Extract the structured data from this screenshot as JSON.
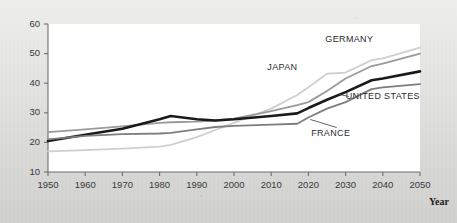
{
  "figure": {
    "background_color": "#d8d8d6",
    "plot_background_color": "#ffffff",
    "axis_color": "#6e6e6e"
  },
  "axis_titles": {
    "x": "Year",
    "y": ""
  },
  "chart_data": {
    "type": "line",
    "title": "",
    "subtitle": "",
    "xlabel": "Year",
    "ylabel": "",
    "xlim": [
      1950,
      2050
    ],
    "ylim": [
      10,
      60
    ],
    "xticks": [
      1950,
      1960,
      1970,
      1980,
      1990,
      2000,
      2010,
      2020,
      2030,
      2040,
      2050
    ],
    "yticks": [
      10,
      20,
      30,
      40,
      50,
      60
    ],
    "grid": false,
    "legend_position": "inline-annotations",
    "annotations": [
      {
        "text": "GERMANY",
        "x": 2031,
        "y": 54.0
      },
      {
        "text": "JAPAN",
        "x": 2013,
        "y": 44.5
      },
      {
        "text": "UNITED STATES",
        "x": 2040,
        "y": 34.5
      },
      {
        "text": "FRANCE",
        "x": 2026,
        "y": 22.0
      }
    ],
    "x": [
      1950,
      1960,
      1970,
      1980,
      1983,
      1990,
      1995,
      2000,
      2010,
      2017,
      2020,
      2025,
      2030,
      2037,
      2040,
      2050
    ],
    "series": [
      {
        "name": "JAPAN",
        "color": "#cfcfcf",
        "width": 1.8,
        "values": [
          17.0,
          17.4,
          17.9,
          18.6,
          19.2,
          21.8,
          24.2,
          26.6,
          31.4,
          36.0,
          38.6,
          43.2,
          43.6,
          47.8,
          48.4,
          52.0
        ]
      },
      {
        "name": "GERMANY",
        "color": "#9a9a9a",
        "width": 1.8,
        "values": [
          23.5,
          24.4,
          25.4,
          26.6,
          26.8,
          27.0,
          27.4,
          28.0,
          30.6,
          32.6,
          33.6,
          37.4,
          41.6,
          45.8,
          46.6,
          50.0
        ]
      },
      {
        "name": "UNITED STATES",
        "color": "#1a1a1a",
        "width": 2.6,
        "values": [
          20.5,
          22.6,
          24.6,
          27.8,
          28.9,
          27.8,
          27.4,
          27.8,
          28.9,
          29.8,
          31.6,
          34.4,
          37.0,
          41.0,
          41.6,
          44.0
        ]
      },
      {
        "name": "FRANCE",
        "color": "#7d7d7d",
        "width": 1.8,
        "values": [
          21.0,
          22.2,
          22.8,
          23.0,
          23.2,
          24.4,
          25.2,
          25.6,
          26.0,
          26.3,
          28.4,
          31.4,
          33.6,
          38.0,
          38.6,
          39.7
        ]
      }
    ]
  }
}
